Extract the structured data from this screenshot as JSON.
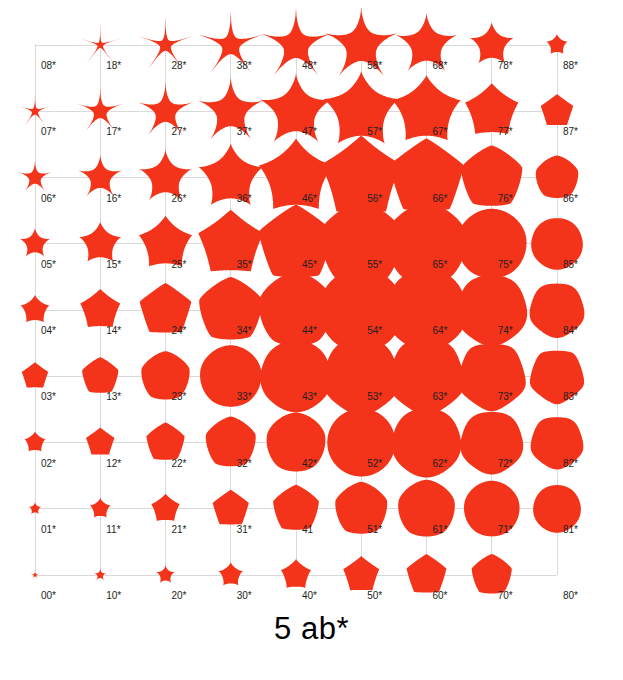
{
  "figure": {
    "title": "5 ab*",
    "background_color": "#ffffff",
    "shape_color": "#f4341a",
    "grid_color": "#d9d9d9",
    "label_color": "#231f20"
  },
  "chart_data": {
    "type": "scatter",
    "title": "5 ab*",
    "xlabel": "",
    "ylabel": "",
    "symmetry_m": 5,
    "grid_rows": 9,
    "grid_cols": 9,
    "x": [
      0,
      1,
      2,
      3,
      4,
      5,
      6,
      7,
      8
    ],
    "y": [
      0,
      1,
      2,
      3,
      4,
      5,
      6,
      7,
      8
    ],
    "xlim": [
      0,
      8
    ],
    "ylim": [
      0,
      8
    ],
    "grid": true,
    "legend": "none",
    "plot_area_px": {
      "left": 35,
      "top": 45,
      "right": 557,
      "bottom": 575
    },
    "label_offset_px": {
      "dx": 6,
      "dy": 24
    },
    "cells": [
      {
        "label": "00*",
        "col": 0,
        "row": 0,
        "n1": 0.45,
        "n2": 0.45,
        "n3": 0.45,
        "size": 5
      },
      {
        "label": "01*",
        "col": 0,
        "row": 1,
        "n1": 0.75,
        "n2": 0.6,
        "n3": 0.6,
        "size": 7
      },
      {
        "label": "02*",
        "col": 0,
        "row": 2,
        "n1": 1.1,
        "n2": 0.8,
        "n3": 0.8,
        "size": 11
      },
      {
        "label": "03*",
        "col": 0,
        "row": 3,
        "n1": 1.5,
        "n2": 1.0,
        "n3": 1.0,
        "size": 14
      },
      {
        "label": "04*",
        "col": 0,
        "row": 4,
        "n1": 1.0,
        "n2": 0.85,
        "n3": 0.85,
        "size": 15
      },
      {
        "label": "05*",
        "col": 0,
        "row": 5,
        "n1": 0.72,
        "n2": 0.7,
        "n3": 0.7,
        "size": 16
      },
      {
        "label": "06*",
        "col": 0,
        "row": 6,
        "n1": 0.5,
        "n2": 0.55,
        "n3": 0.55,
        "size": 17
      },
      {
        "label": "07*",
        "col": 0,
        "row": 7,
        "n1": 0.34,
        "n2": 0.42,
        "n3": 0.42,
        "size": 17
      },
      {
        "label": "08*",
        "col": 0,
        "row": 8,
        "n1": 0.2,
        "n2": 0.3,
        "n3": 0.3,
        "size": 3
      },
      {
        "label": "10*",
        "col": 1,
        "row": 0,
        "n1": 0.6,
        "n2": 0.55,
        "n3": 0.55,
        "size": 7
      },
      {
        "label": "11*",
        "col": 1,
        "row": 1,
        "n1": 1.0,
        "n2": 0.75,
        "n3": 0.75,
        "size": 11
      },
      {
        "label": "12*",
        "col": 1,
        "row": 2,
        "n1": 1.5,
        "n2": 1.0,
        "n3": 1.0,
        "size": 15
      },
      {
        "label": "13*",
        "col": 1,
        "row": 3,
        "n1": 1.9,
        "n2": 1.25,
        "n3": 1.25,
        "size": 19
      },
      {
        "label": "14*",
        "col": 1,
        "row": 4,
        "n1": 1.3,
        "n2": 1.0,
        "n3": 1.0,
        "size": 21
      },
      {
        "label": "15*",
        "col": 1,
        "row": 5,
        "n1": 0.85,
        "n2": 0.8,
        "n3": 0.8,
        "size": 22
      },
      {
        "label": "16*",
        "col": 1,
        "row": 6,
        "n1": 0.6,
        "n2": 0.62,
        "n3": 0.62,
        "size": 23
      },
      {
        "label": "17*",
        "col": 1,
        "row": 7,
        "n1": 0.42,
        "n2": 0.48,
        "n3": 0.48,
        "size": 24
      },
      {
        "label": "18*",
        "col": 1,
        "row": 8,
        "n1": 0.28,
        "n2": 0.36,
        "n3": 0.36,
        "size": 23
      },
      {
        "label": "20*",
        "col": 2,
        "row": 0,
        "n1": 0.8,
        "n2": 0.65,
        "n3": 0.65,
        "size": 10
      },
      {
        "label": "21*",
        "col": 2,
        "row": 1,
        "n1": 1.3,
        "n2": 0.9,
        "n3": 0.9,
        "size": 15
      },
      {
        "label": "22*",
        "col": 2,
        "row": 2,
        "n1": 1.9,
        "n2": 1.2,
        "n3": 1.2,
        "size": 20
      },
      {
        "label": "23*",
        "col": 2,
        "row": 3,
        "n1": 2.4,
        "n2": 1.5,
        "n3": 1.5,
        "size": 25
      },
      {
        "label": "24*",
        "col": 2,
        "row": 4,
        "n1": 1.6,
        "n2": 1.15,
        "n3": 1.15,
        "size": 27
      },
      {
        "label": "25*",
        "col": 2,
        "row": 5,
        "n1": 1.05,
        "n2": 0.92,
        "n3": 0.92,
        "size": 28
      },
      {
        "label": "26*",
        "col": 2,
        "row": 6,
        "n1": 0.7,
        "n2": 0.7,
        "n3": 0.7,
        "size": 28
      },
      {
        "label": "27*",
        "col": 2,
        "row": 7,
        "n1": 0.5,
        "n2": 0.55,
        "n3": 0.55,
        "size": 29
      },
      {
        "label": "28*",
        "col": 2,
        "row": 8,
        "n1": 0.34,
        "n2": 0.42,
        "n3": 0.42,
        "size": 29
      },
      {
        "label": "30*",
        "col": 3,
        "row": 0,
        "n1": 1.0,
        "n2": 0.75,
        "n3": 0.75,
        "size": 13
      },
      {
        "label": "31*",
        "col": 3,
        "row": 1,
        "n1": 1.7,
        "n2": 1.05,
        "n3": 1.05,
        "size": 19
      },
      {
        "label": "32*",
        "col": 3,
        "row": 2,
        "n1": 2.4,
        "n2": 1.4,
        "n3": 1.4,
        "size": 26
      },
      {
        "label": "33*",
        "col": 3,
        "row": 3,
        "n1": 3.2,
        "n2": 1.85,
        "n3": 1.85,
        "size": 31
      },
      {
        "label": "34*",
        "col": 3,
        "row": 4,
        "n1": 2.0,
        "n2": 1.35,
        "n3": 1.35,
        "size": 33
      },
      {
        "label": "35*",
        "col": 3,
        "row": 5,
        "n1": 1.3,
        "n2": 1.05,
        "n3": 1.05,
        "size": 34
      },
      {
        "label": "36*",
        "col": 3,
        "row": 6,
        "n1": 0.85,
        "n2": 0.8,
        "n3": 0.8,
        "size": 34
      },
      {
        "label": "37*",
        "col": 3,
        "row": 7,
        "n1": 0.58,
        "n2": 0.62,
        "n3": 0.62,
        "size": 34
      },
      {
        "label": "38*",
        "col": 3,
        "row": 8,
        "n1": 0.4,
        "n2": 0.48,
        "n3": 0.48,
        "size": 34
      },
      {
        "label": "40*",
        "col": 4,
        "row": 0,
        "n1": 1.25,
        "n2": 0.85,
        "n3": 0.85,
        "size": 16
      },
      {
        "label": "41",
        "col": 4,
        "row": 1,
        "n1": 2.1,
        "n2": 1.2,
        "n3": 1.2,
        "size": 24
      },
      {
        "label": "42*",
        "col": 4,
        "row": 2,
        "n1": 3.0,
        "n2": 1.7,
        "n3": 1.7,
        "size": 30
      },
      {
        "label": "43*",
        "col": 4,
        "row": 3,
        "n1": 4.2,
        "n2": 2.3,
        "n3": 2.3,
        "size": 36
      },
      {
        "label": "44*",
        "col": 4,
        "row": 4,
        "n1": 2.6,
        "n2": 1.6,
        "n3": 1.6,
        "size": 38
      },
      {
        "label": "45*",
        "col": 4,
        "row": 5,
        "n1": 1.65,
        "n2": 1.22,
        "n3": 1.22,
        "size": 39
      },
      {
        "label": "46*",
        "col": 4,
        "row": 6,
        "n1": 1.05,
        "n2": 0.92,
        "n3": 0.92,
        "size": 39
      },
      {
        "label": "47*",
        "col": 4,
        "row": 7,
        "n1": 0.7,
        "n2": 0.7,
        "n3": 0.7,
        "size": 38
      },
      {
        "label": "48*",
        "col": 4,
        "row": 8,
        "n1": 0.48,
        "n2": 0.55,
        "n3": 0.55,
        "size": 37
      },
      {
        "label": "50*",
        "col": 5,
        "row": 0,
        "n1": 1.5,
        "n2": 0.95,
        "n3": 0.95,
        "size": 19
      },
      {
        "label": "51*",
        "col": 5,
        "row": 1,
        "n1": 2.6,
        "n2": 1.4,
        "n3": 1.4,
        "size": 27
      },
      {
        "label": "52*",
        "col": 5,
        "row": 2,
        "n1": 3.9,
        "n2": 2.0,
        "n3": 2.0,
        "size": 34
      },
      {
        "label": "53*",
        "col": 5,
        "row": 3,
        "n1": 5.5,
        "n2": 2.9,
        "n3": 2.9,
        "size": 39
      },
      {
        "label": "54*",
        "col": 5,
        "row": 4,
        "n1": 3.4,
        "n2": 1.95,
        "n3": 1.95,
        "size": 42
      },
      {
        "label": "55*",
        "col": 5,
        "row": 5,
        "n1": 2.1,
        "n2": 1.45,
        "n3": 1.45,
        "size": 43
      },
      {
        "label": "56*",
        "col": 5,
        "row": 6,
        "n1": 1.3,
        "n2": 1.05,
        "n3": 1.05,
        "size": 42
      },
      {
        "label": "57*",
        "col": 5,
        "row": 7,
        "n1": 0.85,
        "n2": 0.8,
        "n3": 0.8,
        "size": 40
      },
      {
        "label": "58*",
        "col": 5,
        "row": 8,
        "n1": 0.56,
        "n2": 0.6,
        "n3": 0.6,
        "size": 38
      },
      {
        "label": "60*",
        "col": 6,
        "row": 0,
        "n1": 1.8,
        "n2": 1.05,
        "n3": 1.05,
        "size": 21
      },
      {
        "label": "61*",
        "col": 6,
        "row": 1,
        "n1": 3.2,
        "n2": 1.6,
        "n3": 1.6,
        "size": 29
      },
      {
        "label": "62*",
        "col": 6,
        "row": 2,
        "n1": 5.0,
        "n2": 2.4,
        "n3": 2.4,
        "size": 35
      },
      {
        "label": "63*",
        "col": 6,
        "row": 3,
        "n1": 7.0,
        "n2": 3.5,
        "n3": 3.5,
        "size": 39
      },
      {
        "label": "64*",
        "col": 6,
        "row": 4,
        "n1": 4.3,
        "n2": 2.3,
        "n3": 2.3,
        "size": 41
      },
      {
        "label": "65*",
        "col": 6,
        "row": 5,
        "n1": 2.6,
        "n2": 1.65,
        "n3": 1.65,
        "size": 41
      },
      {
        "label": "66*",
        "col": 6,
        "row": 6,
        "n1": 1.6,
        "n2": 1.18,
        "n3": 1.18,
        "size": 39
      },
      {
        "label": "67*",
        "col": 6,
        "row": 7,
        "n1": 1.0,
        "n2": 0.88,
        "n3": 0.88,
        "size": 36
      },
      {
        "label": "68*",
        "col": 6,
        "row": 8,
        "n1": 0.65,
        "n2": 0.66,
        "n3": 0.66,
        "size": 32
      },
      {
        "label": "70*",
        "col": 7,
        "row": 0,
        "n1": 2.2,
        "n2": 1.2,
        "n3": 1.2,
        "size": 21
      },
      {
        "label": "71*",
        "col": 7,
        "row": 1,
        "n1": 4.0,
        "n2": 1.85,
        "n3": 1.85,
        "size": 28
      },
      {
        "label": "72*",
        "col": 7,
        "row": 2,
        "n1": 6.4,
        "n2": 2.9,
        "n3": 2.9,
        "size": 32
      },
      {
        "label": "73*",
        "col": 7,
        "row": 3,
        "n1": 9.0,
        "n2": 4.2,
        "n3": 4.2,
        "size": 35
      },
      {
        "label": "74*",
        "col": 7,
        "row": 4,
        "n1": 5.4,
        "n2": 2.7,
        "n3": 2.7,
        "size": 36
      },
      {
        "label": "75*",
        "col": 7,
        "row": 5,
        "n1": 3.2,
        "n2": 1.9,
        "n3": 1.9,
        "size": 35
      },
      {
        "label": "76*",
        "col": 7,
        "row": 6,
        "n1": 1.95,
        "n2": 1.32,
        "n3": 1.32,
        "size": 32
      },
      {
        "label": "77*",
        "col": 7,
        "row": 7,
        "n1": 1.2,
        "n2": 0.98,
        "n3": 0.98,
        "size": 28
      },
      {
        "label": "78*",
        "col": 7,
        "row": 8,
        "n1": 0.76,
        "n2": 0.72,
        "n3": 0.72,
        "size": 23
      },
      {
        "label": "80*",
        "col": 8,
        "row": 0,
        "n1": 0,
        "n2": 0,
        "n3": 0,
        "size": 0
      },
      {
        "label": "81*",
        "col": 8,
        "row": 1,
        "n1": 5.2,
        "n2": 2.2,
        "n3": 2.2,
        "size": 24
      },
      {
        "label": "82*",
        "col": 8,
        "row": 2,
        "n1": 8.5,
        "n2": 3.6,
        "n3": 3.6,
        "size": 27
      },
      {
        "label": "83*",
        "col": 8,
        "row": 3,
        "n1": 12.0,
        "n2": 5.2,
        "n3": 5.2,
        "size": 28
      },
      {
        "label": "84*",
        "col": 8,
        "row": 4,
        "n1": 7.0,
        "n2": 3.2,
        "n3": 3.2,
        "size": 28
      },
      {
        "label": "85*",
        "col": 8,
        "row": 5,
        "n1": 4.0,
        "n2": 2.2,
        "n3": 2.2,
        "size": 26
      },
      {
        "label": "86*",
        "col": 8,
        "row": 6,
        "n1": 2.4,
        "n2": 1.5,
        "n3": 1.5,
        "size": 22
      },
      {
        "label": "87*",
        "col": 8,
        "row": 7,
        "n1": 1.45,
        "n2": 1.1,
        "n3": 1.1,
        "size": 17
      },
      {
        "label": "88*",
        "col": 8,
        "row": 8,
        "n1": 0.9,
        "n2": 0.8,
        "n3": 0.8,
        "size": 11
      }
    ]
  }
}
